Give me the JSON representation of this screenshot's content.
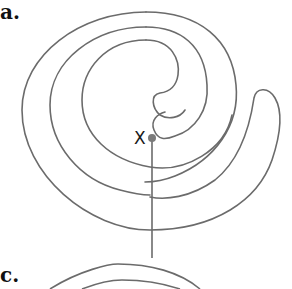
{
  "figure": {
    "panels": [
      {
        "label": "a."
      },
      {
        "label": "c."
      }
    ],
    "marker": {
      "label": "X"
    },
    "colors": {
      "stroke": "#6b6b6b",
      "marker_dot": "#7a7a7a",
      "text": "#111111",
      "background": "#ffffff"
    }
  }
}
